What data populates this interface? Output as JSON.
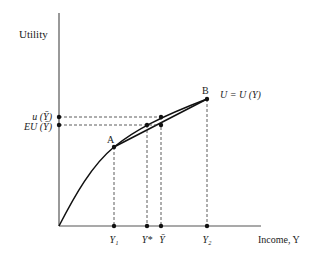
{
  "diagram": {
    "y_axis_label": "Utility",
    "x_axis_label": "Income, Y",
    "curve_label": "U = U (Y)",
    "points": {
      "A": "A",
      "B": "B"
    },
    "y_ticks": {
      "u_ybar": "u (Ȳ)",
      "eu_ybar": "EU (Ȳ)"
    },
    "x_ticks": {
      "y1": "Y₁",
      "ystar": "Y*",
      "ybar": "Ȳ",
      "y2": "Y₂"
    }
  }
}
